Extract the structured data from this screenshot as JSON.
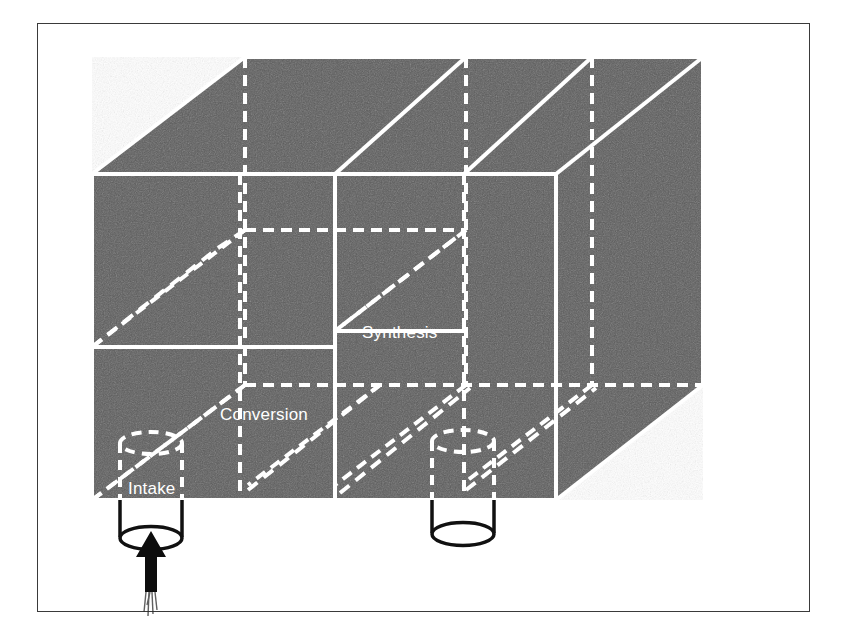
{
  "figure": {
    "frame": {
      "border_color": "#3a3a3a",
      "background": "#ffffff"
    },
    "block": {
      "fill_color": "#5c5c5c",
      "line_color": "#ffffff",
      "description": "Shaded isometric rectangular block subdivided into stacked layers and columns"
    },
    "labels": [
      {
        "id": "synthesis",
        "text": "Synthesis",
        "x": 362,
        "y": 338
      },
      {
        "id": "conversion",
        "text": "Conversion",
        "x": 220,
        "y": 420
      },
      {
        "id": "intake",
        "text": "Intake",
        "x": 128,
        "y": 494
      }
    ],
    "cylinders": [
      {
        "id": "intake-cylinder",
        "label": "Intake",
        "cx": 151,
        "top_y": 432,
        "bottom_y": 540,
        "rx": 31,
        "ry": 11,
        "outline_color": "#111111"
      },
      {
        "id": "output-cylinder",
        "label": "",
        "cx": 463,
        "top_y": 430,
        "bottom_y": 538,
        "rx": 31,
        "ry": 11,
        "outline_color": "#111111"
      }
    ],
    "arrow": {
      "id": "intake-flow-arrow",
      "direction": "up",
      "color": "#0d0d0d",
      "x": 151,
      "from_y": 600,
      "to_y": 535
    }
  }
}
